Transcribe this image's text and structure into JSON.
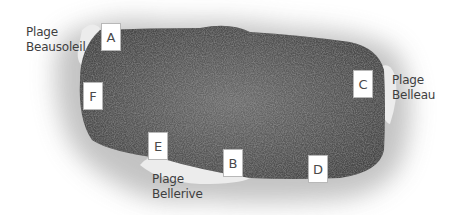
{
  "diagram": {
    "type": "island-map",
    "colors": {
      "land": "#5a5a5a",
      "shallow_halo": "#cfcfcf",
      "beach": "#ececec",
      "label_box_bg": "#ffffff",
      "text": "#3e3e3e"
    },
    "beaches": [
      {
        "id": "beausoleil",
        "line1": "Plage",
        "line2": "Beausoleil"
      },
      {
        "id": "belleau",
        "line1": "Plage",
        "line2": "Belleau"
      },
      {
        "id": "bellerive",
        "line1": "Plage",
        "line2": "Bellerive"
      }
    ],
    "markers": [
      {
        "letter": "A"
      },
      {
        "letter": "B"
      },
      {
        "letter": "C"
      },
      {
        "letter": "D"
      },
      {
        "letter": "E"
      },
      {
        "letter": "F"
      }
    ]
  }
}
